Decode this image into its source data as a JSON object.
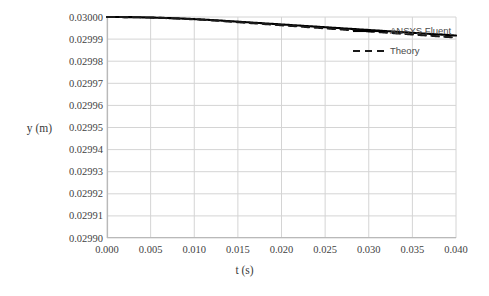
{
  "chart_data": {
    "type": "line",
    "title": "",
    "xlabel": "t (s)",
    "ylabel": "y (m)",
    "xlim": [
      0.0,
      0.04
    ],
    "ylim": [
      0.0299,
      0.03
    ],
    "grid": true,
    "legend_position": "top-right",
    "x_ticks": [
      "0.000",
      "0.005",
      "0.010",
      "0.015",
      "0.020",
      "0.025",
      "0.030",
      "0.035",
      "0.040"
    ],
    "x_tick_values": [
      0.0,
      0.005,
      0.01,
      0.015,
      0.02,
      0.025,
      0.03,
      0.035,
      0.04
    ],
    "y_ticks": [
      "0.03000",
      "0.02999",
      "0.02998",
      "0.02997",
      "0.02996",
      "0.02995",
      "0.02994",
      "0.02993",
      "0.02992",
      "0.02991",
      "0.02990"
    ],
    "y_tick_values": [
      0.03,
      0.02999,
      0.02998,
      0.02997,
      0.02996,
      0.02995,
      0.02994,
      0.02993,
      0.02992,
      0.02991,
      0.0299
    ],
    "x": [
      0.0,
      0.002,
      0.004,
      0.006,
      0.008,
      0.01,
      0.012,
      0.014,
      0.016,
      0.018,
      0.02,
      0.022,
      0.024,
      0.026,
      0.028,
      0.03,
      0.032,
      0.034,
      0.036,
      0.038,
      0.04
    ],
    "series": [
      {
        "name": "ANSYS Fluent",
        "style": "solid",
        "color": "#000000",
        "values": [
          0.03,
          0.0299999,
          0.0299995,
          0.0299989,
          0.0299981,
          0.0299972,
          0.0299962,
          0.0299951,
          0.029994,
          0.0299928,
          0.0299915,
          0.0299902,
          0.0299889,
          0.0299876,
          0.0299862,
          0.0299848,
          0.0299834,
          0.029982,
          0.0299805,
          0.029979,
          0.0299916
        ]
      },
      {
        "name": "Theory",
        "style": "dashed",
        "color": "#1a1a1a",
        "values": [
          0.03,
          0.0299997,
          0.0299991,
          0.0299982,
          0.0299971,
          0.0299958,
          0.0299944,
          0.0299929,
          0.0299913,
          0.0299897,
          0.029988,
          0.0299863,
          0.0299846,
          0.0299828,
          0.029981,
          0.0299792,
          0.0299774,
          0.0299756,
          0.0299738,
          0.029972,
          0.0299907
        ]
      }
    ],
    "series_points": {
      "ansys_fluent": [
        [
          0.0,
          0.03
        ],
        [
          0.001,
          0.0299999
        ],
        [
          0.002,
          0.0299997
        ],
        [
          0.003,
          0.0299994
        ],
        [
          0.004,
          0.0299991
        ],
        [
          0.005,
          0.0299987
        ],
        [
          0.006,
          0.0299983
        ],
        [
          0.008,
          0.0299974
        ],
        [
          0.01,
          0.0299964
        ],
        [
          0.012,
          0.0299953
        ],
        [
          0.014,
          0.0299942
        ],
        [
          0.016,
          0.0299931
        ],
        [
          0.018,
          0.029992
        ],
        [
          0.02,
          0.0299961
        ],
        [
          0.022,
          0.0299953
        ],
        [
          0.024,
          0.0299946
        ],
        [
          0.026,
          0.0299939
        ],
        [
          0.028,
          0.0299932
        ],
        [
          0.03,
          0.0299925
        ],
        [
          0.032,
          0.0299923
        ],
        [
          0.034,
          0.0299921
        ],
        [
          0.036,
          0.0299919
        ],
        [
          0.038,
          0.0299918
        ],
        [
          0.04,
          0.0299916
        ]
      ],
      "theory": [
        [
          0.0,
          0.03
        ],
        [
          0.04,
          0.0299907
        ]
      ]
    }
  },
  "legend": {
    "items": [
      {
        "label": "ANSYS Fluent",
        "style": "solid"
      },
      {
        "label": "Theory",
        "style": "dashed"
      }
    ]
  },
  "axes": {
    "x_title": "t (s)",
    "y_title": "y (m)"
  },
  "colors": {
    "series_line": "#000000",
    "gridline": "#d4d4d4",
    "axis_line": "#b9b9b9",
    "tick_text": "#3f3f3f",
    "background": "#ffffff"
  }
}
